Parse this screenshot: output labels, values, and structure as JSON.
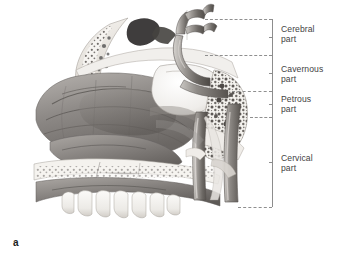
{
  "figure": {
    "letter": "a",
    "illustration_name": "sagittal-skull-base-internal-carotid-artery",
    "palette": {
      "background": "#ffffff",
      "line": "#8f8f8f",
      "label_text": "#3f3f3f",
      "letter_text": "#1c1c1c",
      "ink_dark": "#4a4a4a",
      "ink_mid": "#8c8c8c",
      "ink_light": "#c9c9c9",
      "bone_pale": "#f2f0ec"
    }
  },
  "bracket": {
    "spine_name": "bracket-spine",
    "segments": [
      {
        "id": "cerebral",
        "label": "Cerebral\npart",
        "top": 19,
        "bottom": 55
      },
      {
        "id": "cavernous",
        "label": "Cavernous\npart",
        "top": 55,
        "bottom": 91
      },
      {
        "id": "petrous",
        "label": "Petrous\npart",
        "top": 91,
        "bottom": 117
      },
      {
        "id": "cervical",
        "label": "Cervical\npart",
        "top": 117,
        "bottom": 207
      }
    ],
    "leader_lines": [
      {
        "id": "leader-top",
        "x": 205,
        "y": 19,
        "width": 67
      },
      {
        "id": "leader-cerebral",
        "x": 205,
        "y": 55,
        "width": 67
      },
      {
        "id": "leader-cavernous",
        "x": 232,
        "y": 91,
        "width": 40
      },
      {
        "id": "leader-petrous",
        "x": 250,
        "y": 117,
        "width": 22
      },
      {
        "id": "leader-bottom",
        "x": 238,
        "y": 207,
        "width": 34
      }
    ],
    "labels": {
      "cerebral": "Cerebral\npart",
      "cavernous": "Cavernous\npart",
      "petrous": "Petrous\npart",
      "cervical": "Cervical\npart"
    },
    "label_tops": {
      "cerebral": 24,
      "cavernous": 64,
      "petrous": 94,
      "cervical": 153
    }
  }
}
